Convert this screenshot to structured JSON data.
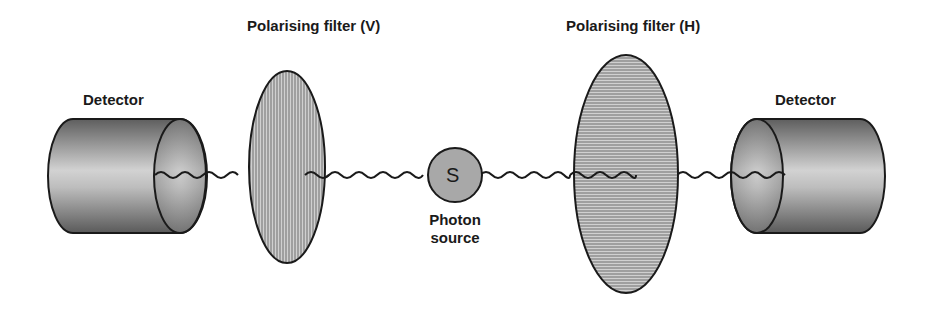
{
  "diagram": {
    "labels": {
      "detector_left": "Detector",
      "filter_vertical": "Polarising filter  (V)",
      "source_symbol": "S",
      "source_caption_line1": "Photon",
      "source_caption_line2": "source",
      "filter_horizontal": "Polarising filter (H)",
      "detector_right": "Detector"
    },
    "components": [
      {
        "name": "detector-left",
        "type": "cylinder"
      },
      {
        "name": "polarising-filter-vertical",
        "type": "ellipse",
        "hatch": "vertical"
      },
      {
        "name": "photon-source",
        "type": "circle"
      },
      {
        "name": "polarising-filter-horizontal",
        "type": "ellipse",
        "hatch": "horizontal"
      },
      {
        "name": "detector-right",
        "type": "cylinder"
      }
    ],
    "colors": {
      "outline": "#1a1a1a",
      "source_fill": "#a8a8a8",
      "hatch_bg": "#c8c8c8",
      "hatch_line": "#707070",
      "cylinder_dark": "#5a5a5a",
      "cylinder_light": "#cfcfcf"
    }
  }
}
